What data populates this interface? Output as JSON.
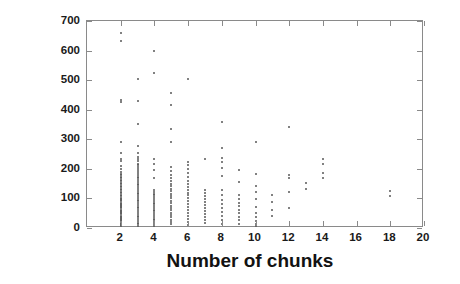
{
  "chart": {
    "type": "scatter",
    "title": "",
    "xlabel": "Number of chunks",
    "ylabel": "Chunk size [words]",
    "xlim": [
      0,
      20
    ],
    "ylim": [
      0,
      700
    ],
    "xticks": [
      2,
      4,
      6,
      8,
      10,
      12,
      14,
      16,
      18,
      20
    ],
    "yticks": [
      0,
      100,
      200,
      300,
      400,
      500,
      600,
      700
    ],
    "grid": false,
    "legend": null,
    "marker_color": "#575757",
    "axis_color": "#8a8a8a",
    "text_color": "#121212"
  },
  "chart_data": {
    "type": "scatter",
    "title": "",
    "xlabel": "Number of chunks",
    "ylabel": "Chunk size [words]",
    "xlim": [
      0,
      20
    ],
    "ylim": [
      0,
      700
    ],
    "xticks": [
      2,
      4,
      6,
      8,
      10,
      12,
      14,
      16,
      18,
      20
    ],
    "yticks": [
      0,
      100,
      200,
      300,
      400,
      500,
      600,
      700
    ],
    "grid": false,
    "series": [
      {
        "name": "chunks",
        "points": [
          [
            2,
            660
          ],
          [
            2,
            632
          ],
          [
            2,
            432
          ],
          [
            2,
            425
          ],
          [
            2,
            292
          ],
          [
            2,
            252
          ],
          [
            2,
            232
          ],
          [
            2,
            225
          ],
          [
            2,
            210
          ],
          [
            2,
            198
          ],
          [
            2,
            188
          ],
          [
            2,
            182
          ],
          [
            2,
            178
          ],
          [
            2,
            172
          ],
          [
            2,
            168
          ],
          [
            2,
            162
          ],
          [
            2,
            158
          ],
          [
            2,
            152
          ],
          [
            2,
            148
          ],
          [
            2,
            142
          ],
          [
            2,
            138
          ],
          [
            2,
            132
          ],
          [
            2,
            128
          ],
          [
            2,
            122
          ],
          [
            2,
            118
          ],
          [
            2,
            112
          ],
          [
            2,
            108
          ],
          [
            2,
            102
          ],
          [
            2,
            98
          ],
          [
            2,
            94
          ],
          [
            2,
            90
          ],
          [
            2,
            86
          ],
          [
            2,
            82
          ],
          [
            2,
            78
          ],
          [
            2,
            74
          ],
          [
            2,
            70
          ],
          [
            2,
            66
          ],
          [
            2,
            62
          ],
          [
            2,
            58
          ],
          [
            2,
            54
          ],
          [
            2,
            50
          ],
          [
            2,
            46
          ],
          [
            2,
            42
          ],
          [
            2,
            38
          ],
          [
            2,
            34
          ],
          [
            2,
            30
          ],
          [
            2,
            26
          ],
          [
            2,
            22
          ],
          [
            2,
            18
          ],
          [
            2,
            14
          ],
          [
            2,
            10
          ],
          [
            2,
            6
          ],
          [
            3,
            505
          ],
          [
            3,
            428
          ],
          [
            3,
            352
          ],
          [
            3,
            278
          ],
          [
            3,
            252
          ],
          [
            3,
            240
          ],
          [
            3,
            232
          ],
          [
            3,
            225
          ],
          [
            3,
            218
          ],
          [
            3,
            212
          ],
          [
            3,
            205
          ],
          [
            3,
            198
          ],
          [
            3,
            192
          ],
          [
            3,
            186
          ],
          [
            3,
            180
          ],
          [
            3,
            174
          ],
          [
            3,
            168
          ],
          [
            3,
            162
          ],
          [
            3,
            156
          ],
          [
            3,
            150
          ],
          [
            3,
            144
          ],
          [
            3,
            138
          ],
          [
            3,
            132
          ],
          [
            3,
            126
          ],
          [
            3,
            120
          ],
          [
            3,
            114
          ],
          [
            3,
            108
          ],
          [
            3,
            102
          ],
          [
            3,
            96
          ],
          [
            3,
            90
          ],
          [
            3,
            84
          ],
          [
            3,
            78
          ],
          [
            3,
            72
          ],
          [
            3,
            66
          ],
          [
            3,
            60
          ],
          [
            3,
            54
          ],
          [
            3,
            48
          ],
          [
            3,
            42
          ],
          [
            3,
            36
          ],
          [
            3,
            30
          ],
          [
            3,
            24
          ],
          [
            3,
            18
          ],
          [
            3,
            12
          ],
          [
            3,
            6
          ],
          [
            4,
            598
          ],
          [
            4,
            525
          ],
          [
            4,
            235
          ],
          [
            4,
            215
          ],
          [
            4,
            195
          ],
          [
            4,
            170
          ],
          [
            4,
            128
          ],
          [
            4,
            122
          ],
          [
            4,
            116
          ],
          [
            4,
            110
          ],
          [
            4,
            104
          ],
          [
            4,
            98
          ],
          [
            4,
            92
          ],
          [
            4,
            86
          ],
          [
            4,
            80
          ],
          [
            4,
            74
          ],
          [
            4,
            68
          ],
          [
            4,
            62
          ],
          [
            4,
            56
          ],
          [
            4,
            50
          ],
          [
            4,
            44
          ],
          [
            4,
            38
          ],
          [
            4,
            32
          ],
          [
            4,
            26
          ],
          [
            4,
            20
          ],
          [
            4,
            14
          ],
          [
            4,
            8
          ],
          [
            5,
            458
          ],
          [
            5,
            415
          ],
          [
            5,
            335
          ],
          [
            5,
            290
          ],
          [
            5,
            205
          ],
          [
            5,
            192
          ],
          [
            5,
            178
          ],
          [
            5,
            168
          ],
          [
            5,
            158
          ],
          [
            5,
            150
          ],
          [
            5,
            142
          ],
          [
            5,
            132
          ],
          [
            5,
            124
          ],
          [
            5,
            116
          ],
          [
            5,
            108
          ],
          [
            5,
            100
          ],
          [
            5,
            92
          ],
          [
            5,
            84
          ],
          [
            5,
            76
          ],
          [
            5,
            68
          ],
          [
            5,
            60
          ],
          [
            5,
            52
          ],
          [
            5,
            44
          ],
          [
            5,
            36
          ],
          [
            5,
            28
          ],
          [
            5,
            20
          ],
          [
            5,
            12
          ],
          [
            6,
            505
          ],
          [
            6,
            222
          ],
          [
            6,
            212
          ],
          [
            6,
            198
          ],
          [
            6,
            185
          ],
          [
            6,
            172
          ],
          [
            6,
            160
          ],
          [
            6,
            150
          ],
          [
            6,
            140
          ],
          [
            6,
            130
          ],
          [
            6,
            120
          ],
          [
            6,
            110
          ],
          [
            6,
            100
          ],
          [
            6,
            90
          ],
          [
            6,
            80
          ],
          [
            6,
            70
          ],
          [
            6,
            60
          ],
          [
            6,
            50
          ],
          [
            6,
            40
          ],
          [
            6,
            30
          ],
          [
            6,
            20
          ],
          [
            6,
            10
          ],
          [
            7,
            232
          ],
          [
            7,
            128
          ],
          [
            7,
            118
          ],
          [
            7,
            108
          ],
          [
            7,
            98
          ],
          [
            7,
            88
          ],
          [
            7,
            78
          ],
          [
            7,
            68
          ],
          [
            7,
            58
          ],
          [
            7,
            48
          ],
          [
            7,
            38
          ],
          [
            7,
            28
          ],
          [
            7,
            18
          ],
          [
            8,
            360
          ],
          [
            8,
            272
          ],
          [
            8,
            238
          ],
          [
            8,
            222
          ],
          [
            8,
            202
          ],
          [
            8,
            175
          ],
          [
            8,
            128
          ],
          [
            8,
            112
          ],
          [
            8,
            96
          ],
          [
            8,
            82
          ],
          [
            8,
            68
          ],
          [
            8,
            54
          ],
          [
            8,
            40
          ],
          [
            8,
            26
          ],
          [
            8,
            12
          ],
          [
            9,
            195
          ],
          [
            9,
            155
          ],
          [
            9,
            112
          ],
          [
            9,
            98
          ],
          [
            9,
            86
          ],
          [
            9,
            74
          ],
          [
            9,
            62
          ],
          [
            9,
            50
          ],
          [
            9,
            38
          ],
          [
            9,
            26
          ],
          [
            9,
            14
          ],
          [
            10,
            292
          ],
          [
            10,
            182
          ],
          [
            10,
            142
          ],
          [
            10,
            122
          ],
          [
            10,
            98
          ],
          [
            10,
            72
          ],
          [
            10,
            52
          ],
          [
            10,
            36
          ],
          [
            10,
            24
          ],
          [
            10,
            14
          ],
          [
            10,
            6
          ],
          [
            11,
            112
          ],
          [
            11,
            88
          ],
          [
            11,
            62
          ],
          [
            11,
            42
          ],
          [
            12,
            342
          ],
          [
            12,
            178
          ],
          [
            12,
            168
          ],
          [
            12,
            122
          ],
          [
            12,
            68
          ],
          [
            13,
            152
          ],
          [
            13,
            132
          ],
          [
            14,
            232
          ],
          [
            14,
            215
          ],
          [
            14,
            185
          ],
          [
            14,
            170
          ],
          [
            18,
            125
          ],
          [
            18,
            108
          ]
        ]
      }
    ]
  }
}
